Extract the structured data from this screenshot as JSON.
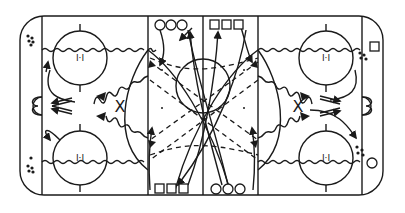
{
  "diagram": {
    "type": "hockey-drill",
    "ink_color": "#1a1a1a",
    "background": "#ffffff",
    "faceoff_label": "I·I",
    "defender_mark": "X",
    "center_dots": "·",
    "groups": {
      "top_left_circles": 3,
      "top_right_squares": 3,
      "bottom_left_squares": 3,
      "bottom_right_circles": 3,
      "right_top_square": 1,
      "right_bottom_circle": 1
    },
    "legend": {
      "solid_line": "skating path",
      "dashed_line": "pass",
      "wavy_line": "skating with puck",
      "arrow": "direction",
      "x": "defender / coach",
      "circle_player": "team A",
      "square_player": "team B",
      "dots": "pucks"
    }
  }
}
